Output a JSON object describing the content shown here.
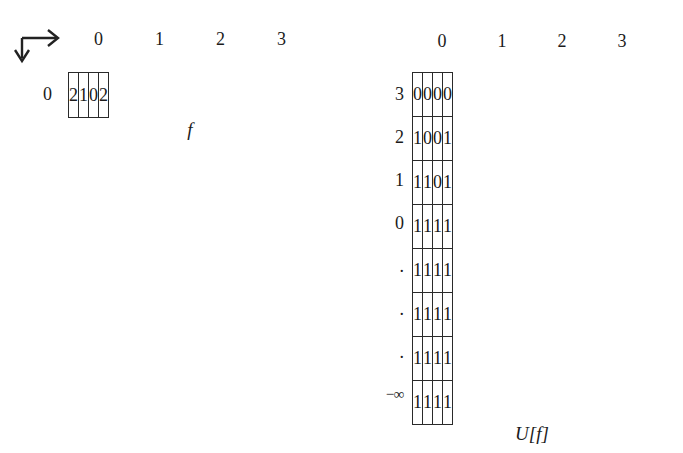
{
  "figure": {
    "background_color": "#ffffff",
    "ink_color": "#1b1b1b"
  },
  "axis_indicator": {
    "name": "axis-orientation-indicator",
    "horizontal_arrow_label": "column index increases right",
    "vertical_arrow_label": "row index increases down"
  },
  "left_figure": {
    "caption": "f",
    "column_headers": [
      "0",
      "1",
      "2",
      "3"
    ],
    "row_labels": [
      "0"
    ],
    "rows": [
      [
        "2",
        "1",
        "0",
        "2"
      ]
    ]
  },
  "right_figure": {
    "caption": "U[f]",
    "column_headers": [
      "0",
      "1",
      "2",
      "3"
    ],
    "row_labels": [
      "3",
      "2",
      "1",
      "0",
      ".",
      ".",
      ".",
      "−∞"
    ],
    "rows": [
      [
        "0",
        "0",
        "0",
        "0"
      ],
      [
        "1",
        "0",
        "0",
        "1"
      ],
      [
        "1",
        "1",
        "0",
        "1"
      ],
      [
        "1",
        "1",
        "1",
        "1"
      ],
      [
        "1",
        "1",
        "1",
        "1"
      ],
      [
        "1",
        "1",
        "1",
        "1"
      ],
      [
        "1",
        "1",
        "1",
        "1"
      ],
      [
        "1",
        "1",
        "1",
        "1"
      ]
    ]
  }
}
